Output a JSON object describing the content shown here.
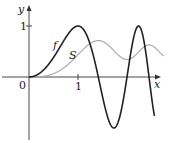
{
  "chart_data": {
    "type": "line",
    "title": "",
    "xlabel": "x",
    "ylabel": "y",
    "xlim": [
      -0.55,
      2.85
    ],
    "ylim": [
      -1.25,
      1.35
    ],
    "x_ticks": [
      {
        "value": 1,
        "label": "1"
      }
    ],
    "y_ticks": [
      {
        "value": 1,
        "label": "1"
      }
    ],
    "origin_label": "0",
    "grid": false,
    "legend": "inline labels",
    "series": [
      {
        "name": "f",
        "label": "f",
        "expression": "sin(pi*x^2/2)",
        "color": "#222222",
        "width": 1.6,
        "x_range": [
          0,
          2.56
        ],
        "key_points": [
          [
            0,
            0
          ],
          [
            1,
            1
          ],
          [
            1.414,
            0
          ],
          [
            1.732,
            -1
          ],
          [
            2,
            0
          ],
          [
            2.236,
            1
          ],
          [
            2.449,
            0
          ]
        ]
      },
      {
        "name": "S",
        "label": "S",
        "expression": "integral_0^x sin(pi*t^2/2) dt",
        "color": "#aaaaaa",
        "width": 1.2,
        "x_range": [
          0,
          2.75
        ],
        "key_points": [
          [
            0,
            0
          ],
          [
            1,
            0.438
          ],
          [
            1.414,
            0.714
          ],
          [
            2,
            0.343
          ],
          [
            2.449,
            0.62
          ]
        ]
      }
    ]
  },
  "labels": {
    "y": "y",
    "x": "x",
    "zero": "0",
    "one_x": "1",
    "one_y": "1",
    "f": "f",
    "S": "S"
  }
}
